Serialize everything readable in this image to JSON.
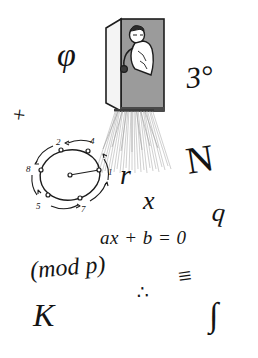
{
  "image": {
    "title": "Hand-drawn mathematical doodle sketch",
    "background_color": "#ffffff",
    "ink_color": "#141414",
    "door_fill_color": "#9a9a9a",
    "door_panel_color": "#f2f2f2",
    "ray_color": "#bdbdbd",
    "width": 258,
    "height": 358
  },
  "symbols": {
    "phi": "φ",
    "three_degrees": "3°",
    "plus": "+",
    "r": "r",
    "N": "N",
    "x": "x",
    "q": "q",
    "linear_equation": "ax + b = 0",
    "modulus": "(mod p)",
    "congruent": "≡",
    "therefore": "∴",
    "K": "K",
    "integral": "∫"
  },
  "scene": {
    "name": "person-peeking-through-doorway",
    "description": "Cartoon figure leaning out of an open door with light rays spilling onto the floor",
    "door_label": "open-door",
    "figure_label": "peeking-person",
    "rays_label": "light-rays"
  },
  "cycle_diagram": {
    "name": "multiplicative-cycle",
    "description": "Circle with labelled nodes and curved arrows showing a repeating cycle",
    "center_label": "",
    "nodes": [
      {
        "label": "1",
        "angle_deg": 0
      },
      {
        "label": "4",
        "angle_deg": 55
      },
      {
        "label": "2",
        "angle_deg": 120
      },
      {
        "label": "8",
        "angle_deg": 180
      },
      {
        "label": "5",
        "angle_deg": 230
      },
      {
        "label": "7",
        "angle_deg": 300
      }
    ],
    "arrow_direction": "counterclockwise"
  }
}
